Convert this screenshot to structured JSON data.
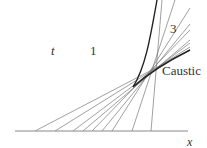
{
  "figure": {
    "labels": {
      "t": "t",
      "region_1": "1",
      "region_3": "3",
      "caustic": "Caustic",
      "x_axis": "x"
    },
    "colors": {
      "line": "#777777",
      "caustic": "#222222",
      "axis": "#888888"
    },
    "axis": {
      "x1": 15,
      "x2": 188,
      "y": 131
    },
    "rays": [
      {
        "x0": 35,
        "x1": 190,
        "y1": 50
      },
      {
        "x0": 55,
        "x1": 190,
        "y1": 47
      },
      {
        "x0": 73,
        "x1": 190,
        "y1": 43
      },
      {
        "x0": 83,
        "x1": 190,
        "y1": 40
      },
      {
        "x0": 92,
        "x1": 190,
        "y1": 30
      },
      {
        "x0": 102,
        "x1": 190,
        "y1": 24
      },
      {
        "x0": 112,
        "x1": 190,
        "y1": 8
      },
      {
        "x0": 132,
        "x1": 175,
        "y1": 0
      },
      {
        "x0": 151,
        "x1": 162,
        "y1": 0
      }
    ],
    "caustic_curve": {
      "upper": "M157,0 C150,40 145,68 133,87",
      "lower": "M133,87 C150,72 170,60 190,50"
    }
  }
}
